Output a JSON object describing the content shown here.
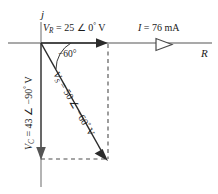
{
  "figure": {
    "type": "phasor-diagram",
    "axes": {
      "vertical_label": "j",
      "horizontal_label": "R"
    },
    "labels": {
      "vr": "V",
      "vr_sub": "R",
      "vr_value": " = 25 ∠ 0",
      "vr_deg": "°",
      "vr_unit": " V",
      "current": "I",
      "current_value": " = 76 mA",
      "angle": "−60°",
      "vs": "V",
      "vs_sub": "S",
      "vs_value": " = 50 ∠ −60",
      "vs_deg": "°",
      "vs_unit": " V",
      "vc": "V",
      "vc_sub": "C",
      "vc_value": " = 43 ∠ −90",
      "vc_deg": "°",
      "vc_unit": " V"
    },
    "colors": {
      "axis": "#8c8c8c",
      "vector": "#2b2b2b",
      "dashed": "#4d4d4d",
      "text": "#1a1a1a"
    },
    "geometry": {
      "origin_x": 41,
      "origin_y": 43,
      "vr_tip_x": 108,
      "vs_tip_x": 108,
      "vs_tip_y": 159,
      "vc_tip_y": 159,
      "angle_degrees": -60
    }
  }
}
